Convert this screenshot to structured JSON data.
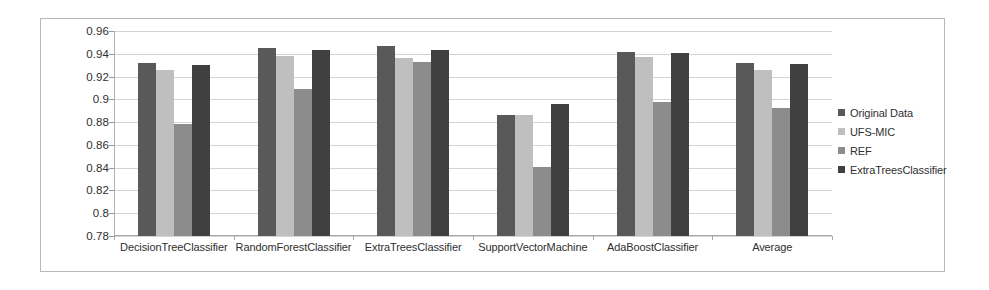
{
  "chart_data": {
    "type": "bar",
    "title": "",
    "subtitle": "",
    "xlabel": "",
    "ylabel": "",
    "grid": true,
    "legend_position": "right",
    "ylim": [
      0.78,
      0.96
    ],
    "ytick_labels": [
      "0.96",
      "0.94",
      "0.92",
      "0.9",
      "0.88",
      "0.86",
      "0.84",
      "0.82",
      "0.8",
      "0.78"
    ],
    "ytick_values": [
      0.96,
      0.94,
      0.92,
      0.9,
      0.88,
      0.86,
      0.84,
      0.82,
      0.8,
      0.78
    ],
    "categories": [
      "DecisionTreeClassifier",
      "RandomForestClassifier",
      "ExtraTreesClassifier",
      "SupportVectorMachine",
      "AdaBoostClassifier",
      "Average"
    ],
    "series": [
      {
        "name": "Original Data",
        "color": "#595959",
        "values": [
          0.932,
          0.945,
          0.947,
          0.886,
          0.942,
          0.932
        ]
      },
      {
        "name": "UFS-MIC",
        "color": "#bfbfbf",
        "values": [
          0.926,
          0.938,
          0.936,
          0.886,
          0.937,
          0.926
        ]
      },
      {
        "name": "REF",
        "color": "#8c8c8c",
        "values": [
          0.878,
          0.909,
          0.933,
          0.841,
          0.898,
          0.892
        ]
      },
      {
        "name": "ExtraTreesClassifier",
        "color": "#404040",
        "values": [
          0.93,
          0.943,
          0.943,
          0.896,
          0.941,
          0.931
        ]
      }
    ]
  },
  "legend": {
    "items": [
      {
        "label": "Original Data",
        "color": "#595959"
      },
      {
        "label": "UFS-MIC",
        "color": "#bfbfbf"
      },
      {
        "label": "REF",
        "color": "#8c8c8c"
      },
      {
        "label": "ExtraTreesClassifier",
        "color": "#404040"
      }
    ]
  },
  "style": {
    "plot_border": "#b8b8b8",
    "gridline": "#d4d4d4",
    "axis": "#a8a8a8",
    "text": "#2f2f2f",
    "background": "#ffffff"
  }
}
